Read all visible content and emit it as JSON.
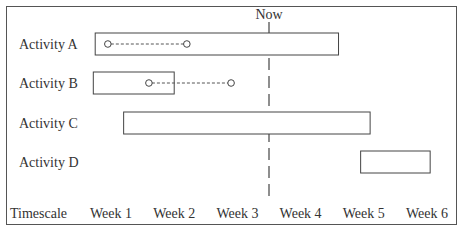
{
  "chart_data": {
    "type": "gantt",
    "title": "",
    "now_label": "Now",
    "now_position_weeks": 3.5,
    "timescale_label": "Timescale",
    "ticks": [
      "Week 1",
      "Week 2",
      "Week 3",
      "Week 4",
      "Week 5",
      "Week 6"
    ],
    "activities": [
      {
        "name": "Activity A",
        "start": 0.75,
        "end": 4.6,
        "float": {
          "from": 0.95,
          "to": 2.2
        }
      },
      {
        "name": "Activity B",
        "start": 0.72,
        "end": 2.0,
        "float": {
          "from": 1.6,
          "to": 2.9
        }
      },
      {
        "name": "Activity C",
        "start": 1.2,
        "end": 5.1,
        "float": null
      },
      {
        "name": "Activity D",
        "start": 4.95,
        "end": 6.05,
        "float": null
      }
    ]
  }
}
